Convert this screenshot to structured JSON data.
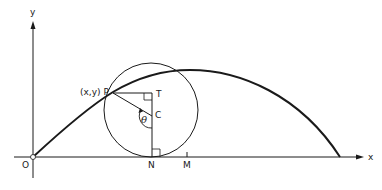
{
  "diagram": {
    "type": "geometry",
    "labels": {
      "y_axis": "y",
      "x_axis": "x",
      "origin": "O",
      "point_p": "(x,y) P",
      "point_t": "T",
      "point_c": "C",
      "point_n": "N",
      "point_m": "M",
      "angle": "θ"
    },
    "colors": {
      "stroke": "#1a1a1a",
      "background": "#ffffff"
    }
  }
}
